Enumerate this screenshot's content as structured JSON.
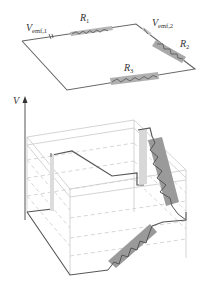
{
  "circuit": {
    "labels": {
      "emf1": {
        "main": "V",
        "sub": "emf,1"
      },
      "emf2": {
        "main": "V",
        "sub": "emf,2"
      },
      "r1": {
        "main": "R",
        "sub": "1"
      },
      "r2": {
        "main": "R",
        "sub": "2"
      },
      "r3": {
        "main": "R",
        "sub": "3"
      }
    }
  },
  "potential_plot": {
    "axis_label": "V"
  },
  "colors": {
    "wire": "#555555",
    "resistor_fill": "#a8a8a8",
    "resistor_fill_dark": "#8f8f8f",
    "battery_fill": "#d9d9d9",
    "box_edge": "#cfcfcf",
    "dashed": "#c8c8c8"
  }
}
